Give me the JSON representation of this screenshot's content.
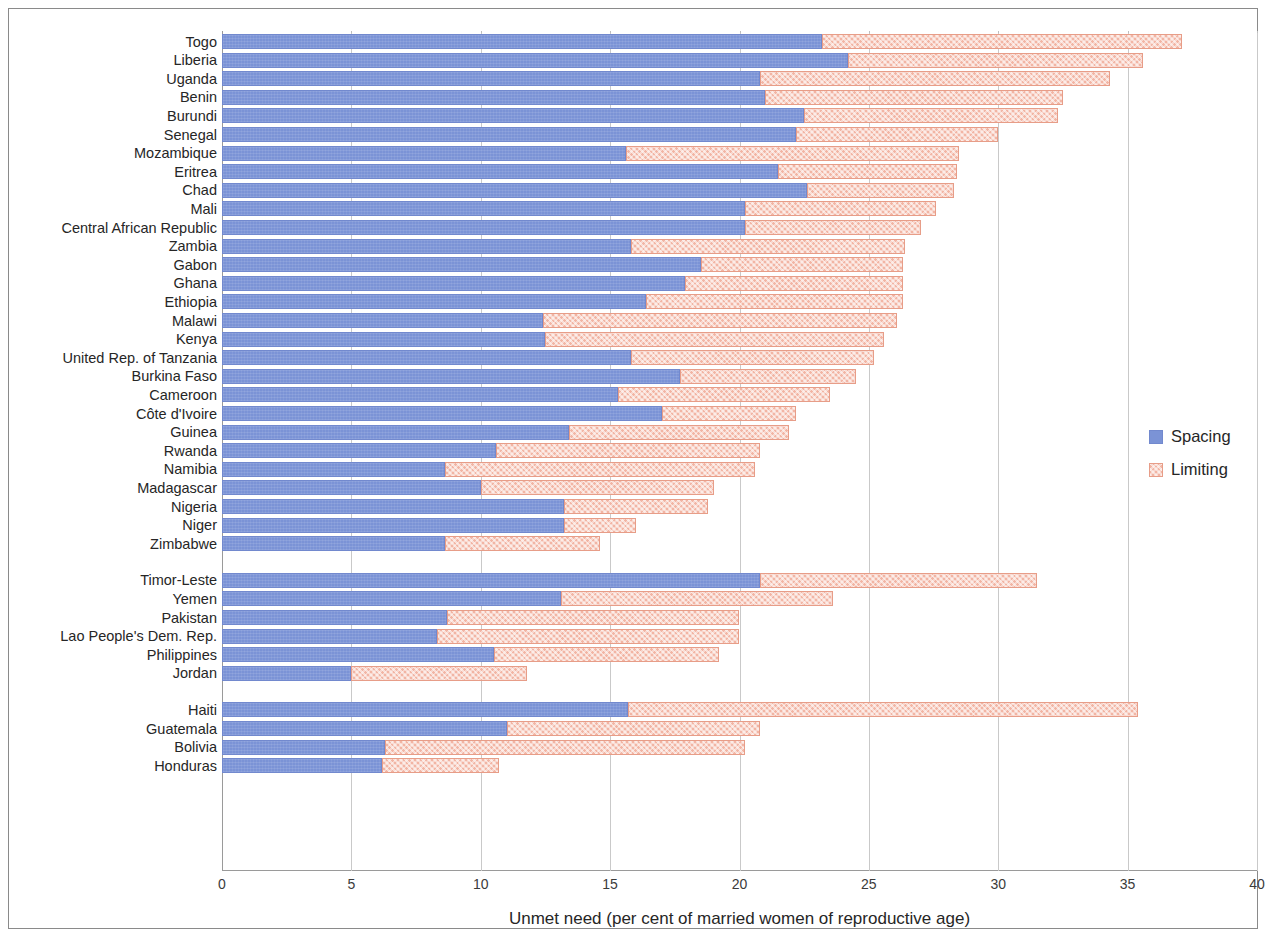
{
  "chart_data": {
    "type": "bar",
    "orientation": "horizontal",
    "stacked": true,
    "title": "",
    "xlabel": "Unmet need (per cent of married women of reproductive age)",
    "ylabel": "",
    "xlim": [
      0,
      40
    ],
    "xticks": [
      0,
      5,
      10,
      15,
      20,
      25,
      30,
      35,
      40
    ],
    "grid": true,
    "legend": {
      "position": "right",
      "entries": [
        {
          "name": "Spacing",
          "color": "#7b93d6"
        },
        {
          "name": "Limiting",
          "color": "#f2b5a4"
        }
      ]
    },
    "series": [
      {
        "name": "Spacing",
        "color": "#7b93d6"
      },
      {
        "name": "Limiting",
        "color": "#f2b5a4"
      }
    ],
    "groups": [
      {
        "name": "",
        "categories": [
          "Togo",
          "Liberia",
          "Uganda",
          "Benin",
          "Burundi",
          "Senegal",
          "Mozambique",
          "Eritrea",
          "Chad",
          "Mali",
          "Central African Republic",
          "Zambia",
          "Gabon",
          "Ghana",
          "Ethiopia",
          "Malawi",
          "Kenya",
          "United Rep. of Tanzania",
          "Burkina Faso",
          "Cameroon",
          "Côte d'Ivoire",
          "Guinea",
          "Rwanda",
          "Namibia",
          "Madagascar",
          "Nigeria",
          "Niger",
          "Zimbabwe"
        ],
        "spacing": [
          23.2,
          24.2,
          20.8,
          21.0,
          22.5,
          22.2,
          15.6,
          21.5,
          22.6,
          20.2,
          20.2,
          15.8,
          18.5,
          17.9,
          16.4,
          12.4,
          12.5,
          15.8,
          17.7,
          15.3,
          17.0,
          13.4,
          10.6,
          8.6,
          10.0,
          13.2,
          13.2,
          8.6
        ],
        "limiting": [
          13.9,
          11.4,
          13.5,
          11.5,
          9.8,
          7.8,
          12.9,
          6.9,
          5.7,
          7.4,
          6.8,
          10.6,
          7.8,
          8.4,
          9.9,
          13.7,
          13.1,
          9.4,
          6.8,
          8.2,
          5.2,
          8.5,
          10.2,
          12.0,
          9.0,
          5.6,
          2.8,
          6.0
        ]
      },
      {
        "name": "",
        "categories": [
          "Timor-Leste",
          "Yemen",
          "Pakistan",
          "Lao People's Dem. Rep.",
          "Philippines",
          "Jordan"
        ],
        "spacing": [
          20.8,
          13.1,
          8.7,
          8.3,
          10.5,
          5.0
        ],
        "limiting": [
          10.7,
          10.5,
          11.3,
          11.7,
          8.7,
          6.8
        ]
      },
      {
        "name": "",
        "categories": [
          "Haiti",
          "Guatemala",
          "Bolivia",
          "Honduras"
        ],
        "spacing": [
          15.7,
          11.0,
          6.3,
          6.2
        ],
        "limiting": [
          19.7,
          9.8,
          13.9,
          4.5
        ]
      }
    ]
  }
}
